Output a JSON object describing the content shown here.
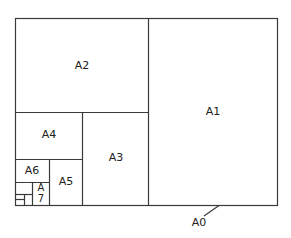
{
  "diagram": {
    "title": "",
    "sheets": [
      {
        "id": "A0",
        "label": "A0"
      },
      {
        "id": "A1",
        "label": "A1"
      },
      {
        "id": "A2",
        "label": "A2"
      },
      {
        "id": "A3",
        "label": "A3"
      },
      {
        "id": "A4",
        "label": "A4"
      },
      {
        "id": "A5",
        "label": "A5"
      },
      {
        "id": "A6",
        "label": "A6"
      },
      {
        "id": "A7",
        "label_line1": "A",
        "label_line2": "7"
      }
    ],
    "colors": {
      "line": "#3a3a3a",
      "text": "#222222",
      "background": "#ffffff"
    }
  }
}
